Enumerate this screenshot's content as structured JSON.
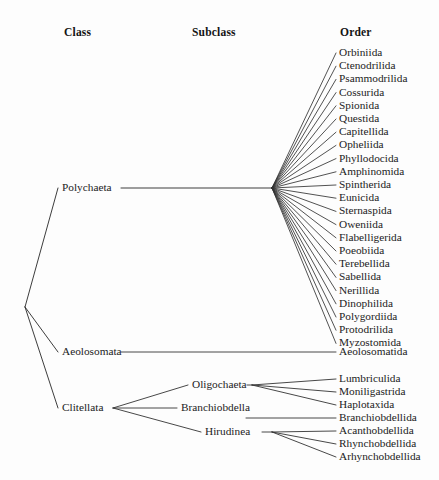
{
  "figure": {
    "type": "cladogram",
    "background_color": "#fdfdfd",
    "line_color": "#333333",
    "text_color": "#1c1c1c"
  },
  "headers": {
    "class": "Class",
    "subclass": "Subclass",
    "order": "Order"
  },
  "classes": [
    {
      "label": "Polychaeta",
      "x": 62,
      "y": 188
    },
    {
      "label": "Aeolosomata",
      "x": 62,
      "y": 352
    },
    {
      "label": "Clitellata",
      "x": 62,
      "y": 408
    }
  ],
  "subclasses": [
    {
      "label": "Oligochaeta",
      "x": 192,
      "y": 385
    },
    {
      "label": "Branchiobdella",
      "x": 181,
      "y": 408
    },
    {
      "label": "Hirudinea",
      "x": 205,
      "y": 432
    }
  ],
  "polychaeta_orders": [
    "Orbiniida",
    "Ctenodrilida",
    "Psammodrilida",
    "Cossurida",
    "Spionida",
    "Questida",
    "Capitellida",
    "Opheliida",
    "Phyllodocida",
    "Amphinomida",
    "Spintherida",
    "Eunicida",
    "Sternaspida",
    "Oweniida",
    "Flabelligerida",
    "Poeobiida",
    "Terebellida",
    "Sabellida",
    "Nerillida",
    "Dinophilida",
    "Polygordiida",
    "Protodrilida",
    "Myzostomida"
  ],
  "aeolosomata_orders": [
    "Aeolosomatida"
  ],
  "oligochaeta_orders": [
    "Lumbriculida",
    "Moniligastrida",
    "Haplotaxida"
  ],
  "branchiobdella_orders": [
    "Branchiobdellida"
  ],
  "hirudinea_orders": [
    "Acanthobdellida",
    "Rhynchobdellida",
    "Arhynchobdellida"
  ],
  "layout": {
    "root_node": {
      "x": 25,
      "y": 307
    },
    "polychaeta_fan_node": {
      "x": 272,
      "y": 188
    },
    "clitellata_node": {
      "x": 113,
      "y": 408
    },
    "oligochaeta_node": {
      "x": 252,
      "y": 385
    },
    "hirudinea_node": {
      "x": 272,
      "y": 432
    },
    "order_label_x": 339,
    "tip_x": 336,
    "order_start_y": 53,
    "order_step": 13.2,
    "aeolosomatida_y": 352,
    "bottom_start_y": 379,
    "bottom_step": 13.0,
    "header_y": 33
  }
}
